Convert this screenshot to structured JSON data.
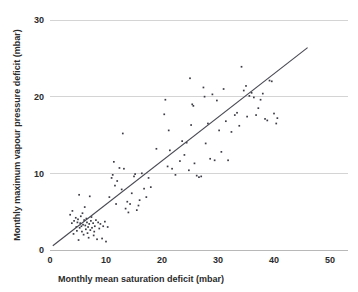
{
  "chart_data": {
    "type": "scatter",
    "title": "",
    "subtitle": "",
    "xlabel": "Monthly mean saturation deficit (mbar)",
    "ylabel": "Monthly maximum vapour pressure deficit (mbar)",
    "xlim": [
      0,
      50
    ],
    "ylim": [
      0,
      30
    ],
    "xticks": [
      0,
      10,
      20,
      30,
      40,
      50
    ],
    "yticks": [
      0,
      10,
      20,
      30
    ],
    "xtick_labels": [
      "0",
      "10",
      "20",
      "30",
      "40",
      "50"
    ],
    "ytick_labels": [
      "0",
      "10",
      "20",
      "30"
    ],
    "grid": "horizontal",
    "gridlines_y": [
      10,
      20,
      30
    ],
    "legend": "none",
    "marker": {
      "shape": "square",
      "size_px": 1.7,
      "color": "#3c3c46"
    },
    "trendline": {
      "type": "linear",
      "color": "#4a4a55",
      "x_start": 0.5,
      "y_start": 0.55,
      "x_end": 46.0,
      "y_end": 26.4,
      "slope": 0.568,
      "intercept": 0.27
    },
    "series": [
      {
        "name": "Monthly observations",
        "points": [
          [
            3.6,
            4.6
          ],
          [
            3.9,
            3.5
          ],
          [
            4.0,
            5.1
          ],
          [
            4.2,
            2.1
          ],
          [
            4.3,
            3.8
          ],
          [
            4.6,
            4.2
          ],
          [
            4.7,
            3.0
          ],
          [
            4.8,
            2.5
          ],
          [
            4.9,
            3.6
          ],
          [
            5.0,
            4.0
          ],
          [
            5.1,
            1.3
          ],
          [
            5.2,
            7.2
          ],
          [
            5.3,
            2.9
          ],
          [
            5.4,
            3.5
          ],
          [
            5.5,
            4.4
          ],
          [
            5.6,
            3.1
          ],
          [
            5.7,
            2.4
          ],
          [
            5.8,
            4.8
          ],
          [
            5.9,
            3.3
          ],
          [
            6.0,
            2.0
          ],
          [
            6.1,
            3.9
          ],
          [
            6.2,
            5.6
          ],
          [
            6.3,
            3.2
          ],
          [
            6.4,
            2.7
          ],
          [
            6.5,
            4.1
          ],
          [
            6.6,
            3.6
          ],
          [
            6.7,
            2.2
          ],
          [
            6.8,
            3.0
          ],
          [
            6.9,
            1.6
          ],
          [
            7.0,
            3.4
          ],
          [
            7.1,
            7.0
          ],
          [
            7.2,
            2.6
          ],
          [
            7.3,
            3.8
          ],
          [
            7.4,
            4.3
          ],
          [
            7.5,
            2.9
          ],
          [
            7.7,
            3.5
          ],
          [
            7.8,
            1.9
          ],
          [
            7.9,
            2.4
          ],
          [
            8.0,
            3.1
          ],
          [
            8.2,
            3.9
          ],
          [
            8.4,
            1.4
          ],
          [
            8.6,
            3.6
          ],
          [
            8.8,
            2.8
          ],
          [
            9.0,
            3.4
          ],
          [
            9.3,
            1.5
          ],
          [
            9.5,
            3.1
          ],
          [
            9.8,
            3.7
          ],
          [
            10.0,
            1.1
          ],
          [
            10.3,
            3.0
          ],
          [
            10.6,
            6.9
          ],
          [
            11.0,
            9.4
          ],
          [
            11.2,
            9.8
          ],
          [
            11.4,
            11.5
          ],
          [
            11.6,
            8.4
          ],
          [
            11.8,
            6.0
          ],
          [
            12.0,
            9.0
          ],
          [
            12.4,
            10.7
          ],
          [
            12.8,
            7.9
          ],
          [
            13.0,
            15.2
          ],
          [
            13.2,
            10.6
          ],
          [
            13.5,
            5.4
          ],
          [
            13.8,
            6.3
          ],
          [
            14.0,
            4.9
          ],
          [
            14.3,
            6.0
          ],
          [
            14.6,
            7.4
          ],
          [
            15.0,
            9.6
          ],
          [
            15.2,
            9.9
          ],
          [
            15.5,
            5.2
          ],
          [
            15.8,
            5.8
          ],
          [
            16.0,
            6.5
          ],
          [
            16.4,
            10.0
          ],
          [
            16.8,
            8.0
          ],
          [
            17.2,
            6.9
          ],
          [
            17.6,
            9.4
          ],
          [
            18.0,
            8.2
          ],
          [
            19.0,
            13.2
          ],
          [
            20.4,
            17.7
          ],
          [
            20.6,
            19.6
          ],
          [
            21.0,
            10.9
          ],
          [
            21.2,
            15.6
          ],
          [
            21.4,
            13.0
          ],
          [
            21.8,
            10.6
          ],
          [
            22.4,
            9.8
          ],
          [
            23.2,
            11.6
          ],
          [
            23.6,
            14.2
          ],
          [
            24.0,
            12.4
          ],
          [
            24.4,
            14.0
          ],
          [
            24.8,
            10.4
          ],
          [
            25.0,
            22.4
          ],
          [
            25.2,
            16.3
          ],
          [
            25.4,
            19.0
          ],
          [
            25.6,
            18.8
          ],
          [
            25.8,
            11.3
          ],
          [
            26.2,
            9.7
          ],
          [
            26.6,
            9.5
          ],
          [
            27.0,
            9.6
          ],
          [
            27.4,
            21.2
          ],
          [
            27.6,
            20.0
          ],
          [
            27.8,
            13.9
          ],
          [
            28.2,
            16.5
          ],
          [
            28.6,
            11.9
          ],
          [
            29.0,
            20.3
          ],
          [
            29.4,
            11.7
          ],
          [
            29.8,
            19.5
          ],
          [
            30.2,
            15.6
          ],
          [
            30.6,
            12.8
          ],
          [
            31.0,
            21.0
          ],
          [
            31.4,
            16.8
          ],
          [
            31.8,
            11.7
          ],
          [
            32.4,
            15.4
          ],
          [
            33.0,
            17.6
          ],
          [
            33.4,
            17.9
          ],
          [
            33.8,
            16.2
          ],
          [
            34.2,
            23.9
          ],
          [
            34.6,
            20.8
          ],
          [
            35.0,
            21.4
          ],
          [
            35.2,
            17.4
          ],
          [
            35.6,
            20.1
          ],
          [
            36.0,
            20.5
          ],
          [
            36.4,
            19.9
          ],
          [
            36.8,
            17.6
          ],
          [
            37.2,
            18.5
          ],
          [
            37.6,
            19.6
          ],
          [
            38.0,
            20.4
          ],
          [
            38.4,
            17.1
          ],
          [
            38.8,
            16.9
          ],
          [
            39.2,
            22.1
          ],
          [
            39.6,
            22.0
          ],
          [
            40.0,
            17.8
          ],
          [
            40.4,
            16.5
          ],
          [
            40.6,
            17.2
          ]
        ]
      }
    ]
  }
}
